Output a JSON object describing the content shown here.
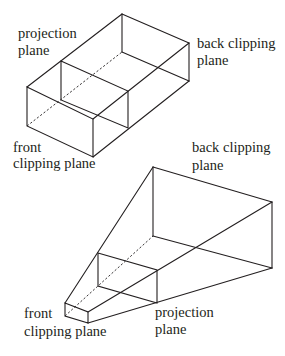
{
  "diagram": {
    "stroke_color": "#231f20",
    "background": "#ffffff",
    "parallel_volume": {
      "description": "Parallel (orthographic) view volume box",
      "labels": {
        "projection_plane": [
          "projection",
          "plane"
        ],
        "back_clipping_plane": [
          "back clipping",
          "plane"
        ],
        "front_clipping_plane": [
          "front",
          "clipping plane"
        ]
      }
    },
    "perspective_volume": {
      "description": "Perspective view volume frustum",
      "labels": {
        "back_clipping_plane": [
          "back clipping",
          "plane"
        ],
        "front_clipping_plane": [
          "front",
          "clipping plane"
        ],
        "projection_plane": [
          "projection",
          "plane"
        ]
      }
    }
  }
}
